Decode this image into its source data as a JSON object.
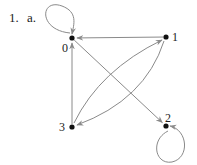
{
  "problem": {
    "number": "1.",
    "part": "a."
  },
  "graph": {
    "type": "directed",
    "nodes": [
      {
        "id": "0",
        "label": "0"
      },
      {
        "id": "1",
        "label": "1"
      },
      {
        "id": "2",
        "label": "2"
      },
      {
        "id": "3",
        "label": "3"
      }
    ],
    "edges": [
      {
        "from": "0",
        "to": "0",
        "kind": "self-loop"
      },
      {
        "from": "1",
        "to": "0",
        "kind": "straight"
      },
      {
        "from": "3",
        "to": "0",
        "kind": "straight"
      },
      {
        "from": "0",
        "to": "2",
        "kind": "straight"
      },
      {
        "from": "3",
        "to": "1",
        "kind": "curved"
      },
      {
        "from": "1",
        "to": "3",
        "kind": "curved"
      },
      {
        "from": "2",
        "to": "2",
        "kind": "self-loop"
      }
    ],
    "colors": {
      "edge": "#8a8a8a",
      "node": "#111111"
    }
  }
}
